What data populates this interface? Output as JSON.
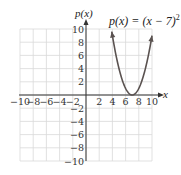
{
  "chart_data": {
    "type": "line",
    "title_parts": {
      "func": "p(x) = (x − 7)",
      "exp": "2"
    },
    "xlabel": "x",
    "ylabel": "p(x)",
    "xlim": [
      -10,
      10
    ],
    "ylim": [
      -10,
      10
    ],
    "grid": true,
    "grid_step": 2,
    "x_ticks": [
      -10,
      -8,
      -6,
      -4,
      -2,
      2,
      4,
      6,
      8,
      10
    ],
    "x_tick_labels": [
      "−10",
      "−8",
      "−6",
      "−4",
      "−2",
      "2",
      "4",
      "6",
      "8",
      "10"
    ],
    "y_ticks": [
      10,
      8,
      6,
      4,
      2,
      -2,
      -4,
      -6,
      -8,
      -10
    ],
    "y_tick_labels": [
      "10",
      "8",
      "6",
      "4",
      "2",
      "−2",
      "−4",
      "−6",
      "−8",
      "−10"
    ],
    "series": [
      {
        "name": "p(x) = (x − 7)²",
        "expression": "(x - 7)^2",
        "x_range": [
          3.9,
          10
        ],
        "arrows_at_ends": true,
        "x": [
          3.9,
          4,
          5,
          6,
          7,
          8,
          9,
          10
        ],
        "y": [
          9.61,
          9,
          4,
          1,
          0,
          1,
          4,
          9
        ],
        "vertex": [
          7,
          0
        ]
      }
    ],
    "colors": {
      "curve": "#5a5250",
      "grid": "#d9d9d9",
      "axes": "#333333"
    }
  }
}
